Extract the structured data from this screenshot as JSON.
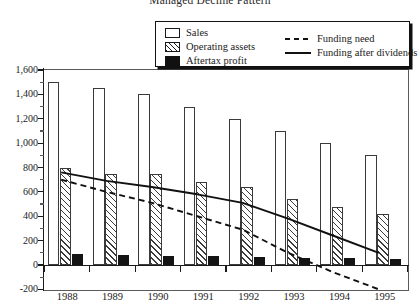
{
  "chart_data": {
    "type": "bar",
    "title": "Managed Decline Pattern",
    "xlabel": "",
    "ylabel": "",
    "categories": [
      "1988",
      "1989",
      "1990",
      "1991",
      "1992",
      "1993",
      "1994",
      "1995"
    ],
    "ylim": [
      -200,
      1600
    ],
    "ytick_values": [
      -200,
      0,
      200,
      400,
      600,
      800,
      1000,
      1200,
      1400,
      1600
    ],
    "ytick_labels": [
      "-200",
      "0",
      "200",
      "400",
      "600",
      "800",
      "1,000",
      "1,200",
      "1,400",
      "1,600"
    ],
    "grid": false,
    "legend_position": "top-right",
    "bar_series": [
      {
        "name": "Sales",
        "style": "open",
        "values": [
          1500,
          1450,
          1400,
          1300,
          1200,
          1100,
          1000,
          900
        ]
      },
      {
        "name": "Operating assets",
        "style": "hatched",
        "values": [
          800,
          750,
          750,
          680,
          640,
          540,
          480,
          420
        ]
      },
      {
        "name": "Aftertax profit",
        "style": "solid-black",
        "values": [
          90,
          80,
          75,
          70,
          65,
          60,
          55,
          50
        ]
      }
    ],
    "line_series": [
      {
        "name": "Funding need",
        "style": "dashed",
        "values": [
          700,
          600,
          510,
          400,
          290,
          100,
          -60,
          -200
        ]
      },
      {
        "name": "Funding after dividends",
        "style": "solid",
        "values": [
          760,
          690,
          640,
          580,
          510,
          380,
          240,
          100
        ]
      }
    ]
  },
  "legend": {
    "items": [
      {
        "label": "Sales",
        "key": "swatch-open"
      },
      {
        "label": "Operating assets",
        "key": "swatch-hatched"
      },
      {
        "label": "Aftertax profit",
        "key": "swatch-black"
      },
      {
        "label": "Funding need",
        "key": "line-dashed"
      },
      {
        "label": "Funding after dividends",
        "key": "line-solid"
      }
    ]
  },
  "colors": {
    "ink": "#1a1a1a",
    "bar_outline": "#3a3a3a",
    "profit_fill": "#141414",
    "background": "#ffffff"
  }
}
